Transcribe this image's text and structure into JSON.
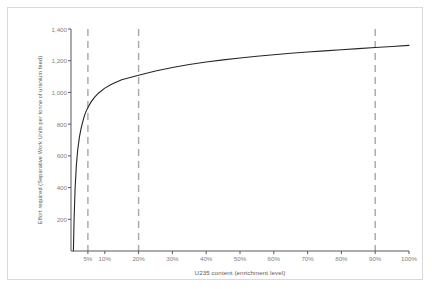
{
  "chart_data": {
    "type": "line",
    "title": "",
    "xlabel": "U235 content (enrichment level)",
    "ylabel": "Effort required (Separative Work Units per tonne of uranium feed)",
    "xlim": [
      0,
      100
    ],
    "ylim": [
      0,
      1400
    ],
    "grid": false,
    "legend": "none",
    "x_tick_labels": [
      "5%",
      "10%",
      "20%",
      "30%",
      "40%",
      "50%",
      "60%",
      "70%",
      "80%",
      "90%",
      "100%"
    ],
    "x_tick_values": [
      5,
      10,
      20,
      30,
      40,
      50,
      60,
      70,
      80,
      90,
      100
    ],
    "y_tick_labels": [
      "200",
      "400",
      "600",
      "800",
      "1,000",
      "1,200",
      "1,400"
    ],
    "y_tick_values": [
      200,
      400,
      600,
      800,
      1000,
      1200,
      1400
    ],
    "series": [
      {
        "name": "SWU per tonne of uranium feed",
        "color": "#262626",
        "x": [
          0.711,
          0.9,
          1.2,
          1.6,
          2.0,
          2.5,
          3.0,
          3.5,
          4.0,
          4.5,
          5.0,
          6.0,
          7.0,
          8.0,
          10.0,
          12.0,
          15.0,
          20.0,
          25.0,
          30.0,
          35.0,
          40.0,
          45.0,
          50.0,
          55.0,
          60.0,
          65.0,
          70.0,
          75.0,
          80.0,
          85.0,
          90.0,
          95.0,
          100.0
        ],
        "y": [
          0,
          190,
          390,
          545,
          640,
          720,
          775,
          818,
          855,
          882,
          905,
          942,
          970,
          993,
          1027,
          1052,
          1080,
          1108,
          1135,
          1157,
          1176,
          1192,
          1205,
          1217,
          1228,
          1238,
          1247,
          1255,
          1262,
          1269,
          1276,
          1283,
          1290,
          1297
        ]
      }
    ],
    "reference_lines": [
      {
        "label": "5%",
        "x": 5,
        "style": "dashed",
        "color": "#a6a6a6"
      },
      {
        "label": "20%",
        "x": 20,
        "style": "dashed",
        "color": "#a6a6a6"
      },
      {
        "label": "90%",
        "x": 90,
        "style": "dashed",
        "color": "#a6a6a6"
      }
    ],
    "axis_color": "#595959",
    "tick_label_color": "#7f7f7f",
    "frame_color": "#d9d9d9",
    "background_color": "#ffffff"
  }
}
